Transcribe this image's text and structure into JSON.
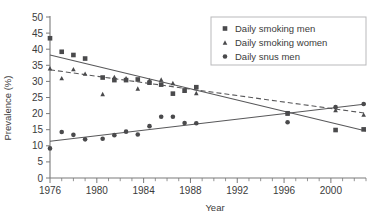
{
  "chart_data": {
    "type": "scatter",
    "title": "",
    "xlabel": "Year",
    "ylabel": "Prevalence (%)",
    "xlim": [
      1976,
      2003
    ],
    "ylim": [
      0,
      50
    ],
    "grid": false,
    "legend_position": "top-right",
    "y_ticks": [
      0,
      5,
      10,
      15,
      20,
      25,
      30,
      35,
      40,
      45,
      50
    ],
    "y_tick_labels": [
      "0",
      "5",
      "10",
      "15",
      "20",
      "25",
      "30",
      "35",
      "40",
      "45",
      "50"
    ],
    "x_ticks": [
      1976,
      1980,
      1984,
      1988,
      1992,
      1996,
      2000
    ],
    "x_tick_labels": [
      "1976",
      "1980",
      "1984",
      "1988",
      "1992",
      "1996",
      "2000"
    ],
    "x_minor_tick_step": 1,
    "series": [
      {
        "name": "Daily smoking men",
        "marker": "square",
        "color": "#4a4a4c",
        "trendline": "solid",
        "trend_endpoints": [
          {
            "x": 1976,
            "y": 38.2
          },
          {
            "x": 2003,
            "y": 14.6
          }
        ],
        "points": [
          {
            "x": 1976,
            "y": 43.4
          },
          {
            "x": 1977,
            "y": 39.2
          },
          {
            "x": 1978,
            "y": 38.2
          },
          {
            "x": 1979,
            "y": 37.1
          },
          {
            "x": 1980.5,
            "y": 31.2
          },
          {
            "x": 1981.5,
            "y": 30.4
          },
          {
            "x": 1982.5,
            "y": 30.4
          },
          {
            "x": 1983.5,
            "y": 30.6
          },
          {
            "x": 1984.5,
            "y": 29.6
          },
          {
            "x": 1985.5,
            "y": 29.0
          },
          {
            "x": 1986.5,
            "y": 26.2
          },
          {
            "x": 1987.5,
            "y": 27.2
          },
          {
            "x": 1988.5,
            "y": 28.2
          },
          {
            "x": 1996.3,
            "y": 20.1
          },
          {
            "x": 2000.4,
            "y": 14.9
          },
          {
            "x": 2002.8,
            "y": 15.1
          }
        ]
      },
      {
        "name": "Daily smoking women",
        "marker": "triangle",
        "color": "#4a4a4c",
        "trendline": "dashed",
        "trend_endpoints": [
          {
            "x": 1976,
            "y": 33.6
          },
          {
            "x": 2003,
            "y": 20.1
          }
        ],
        "points": [
          {
            "x": 1976,
            "y": 34.1
          },
          {
            "x": 1977,
            "y": 31.0
          },
          {
            "x": 1978,
            "y": 33.8
          },
          {
            "x": 1979,
            "y": 32.4
          },
          {
            "x": 1980.5,
            "y": 26.1
          },
          {
            "x": 1981.5,
            "y": 31.4
          },
          {
            "x": 1982.5,
            "y": 31.0
          },
          {
            "x": 1983.5,
            "y": 27.8
          },
          {
            "x": 1984.5,
            "y": 30.4
          },
          {
            "x": 1985.5,
            "y": 30.6
          },
          {
            "x": 1986.5,
            "y": 29.5
          },
          {
            "x": 1987.5,
            "y": 27.1
          },
          {
            "x": 1988.5,
            "y": 26.4
          },
          {
            "x": 1996.3,
            "y": 20.0
          },
          {
            "x": 2000.4,
            "y": 21.1
          },
          {
            "x": 2002.8,
            "y": 19.7
          }
        ]
      },
      {
        "name": "Daily snus men",
        "marker": "circle",
        "color": "#4a4a4c",
        "trendline": "solid",
        "trend_endpoints": [
          {
            "x": 1976,
            "y": 11.4
          },
          {
            "x": 2003,
            "y": 23.0
          }
        ],
        "points": [
          {
            "x": 1976,
            "y": 9.2
          },
          {
            "x": 1977,
            "y": 14.3
          },
          {
            "x": 1978,
            "y": 13.4
          },
          {
            "x": 1979,
            "y": 12.0
          },
          {
            "x": 1980.5,
            "y": 12.2
          },
          {
            "x": 1981.5,
            "y": 13.3
          },
          {
            "x": 1982.5,
            "y": 14.4
          },
          {
            "x": 1983.5,
            "y": 13.5
          },
          {
            "x": 1984.5,
            "y": 16.1
          },
          {
            "x": 1985.5,
            "y": 19.0
          },
          {
            "x": 1986.5,
            "y": 19.0
          },
          {
            "x": 1987.5,
            "y": 17.1
          },
          {
            "x": 1988.5,
            "y": 17.0
          },
          {
            "x": 1996.3,
            "y": 17.3
          },
          {
            "x": 2000.4,
            "y": 22.0
          },
          {
            "x": 2002.8,
            "y": 23.0
          }
        ]
      }
    ],
    "legend": [
      {
        "label": "Daily smoking men",
        "marker": "square"
      },
      {
        "label": "Daily smoking women",
        "marker": "triangle"
      },
      {
        "label": "Daily snus men",
        "marker": "circle"
      }
    ]
  }
}
